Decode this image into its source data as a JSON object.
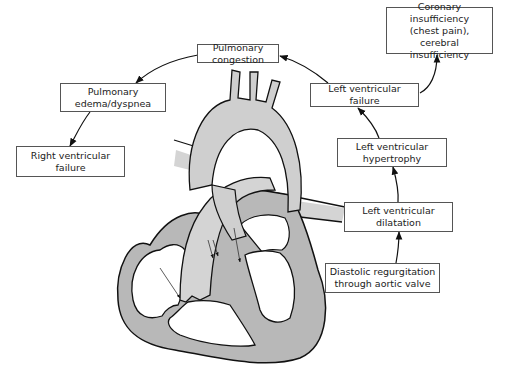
{
  "diagram": {
    "type": "flow-cycle-with-illustration",
    "colors": {
      "line": "#111111",
      "box_border": "#555555",
      "heart_wall": "#b8b8b8",
      "vessel_fill": "#d4d4d4",
      "chamber_fill": "#ffffff",
      "background": "#ffffff"
    },
    "nodes": [
      {
        "id": "coronary",
        "lines": [
          "Coronary insufficiency",
          "(chest pain), cerebral",
          "insufficiency"
        ]
      },
      {
        "id": "pulm_congestion",
        "lines": [
          "Pulmonary congestion"
        ]
      },
      {
        "id": "pulm_edema",
        "lines": [
          "Pulmonary",
          "edema/dyspnea"
        ]
      },
      {
        "id": "rv_failure",
        "lines": [
          "Right ventricular",
          "failure"
        ]
      },
      {
        "id": "lv_failure",
        "lines": [
          "Left ventricular failure"
        ]
      },
      {
        "id": "lv_hypertrophy",
        "lines": [
          "Left ventricular",
          "hypertrophy"
        ]
      },
      {
        "id": "lv_dilatation",
        "lines": [
          "Left ventricular",
          "dilatation"
        ]
      },
      {
        "id": "diastolic_regurg",
        "lines": [
          "Diastolic regurgitation",
          "through aortic valve"
        ]
      }
    ],
    "edges": [
      {
        "from": "diastolic_regurg",
        "to": "lv_dilatation"
      },
      {
        "from": "lv_dilatation",
        "to": "lv_hypertrophy"
      },
      {
        "from": "lv_hypertrophy",
        "to": "lv_failure"
      },
      {
        "from": "lv_failure",
        "to": "coronary"
      },
      {
        "from": "lv_failure",
        "to": "pulm_congestion"
      },
      {
        "from": "pulm_congestion",
        "to": "pulm_edema"
      },
      {
        "from": "pulm_edema",
        "to": "rv_failure"
      }
    ],
    "illustration": {
      "name": "heart-cross-section",
      "features": [
        "aortic arch with three branches",
        "pulmonary artery",
        "left and right atria",
        "left and right ventricles",
        "valve flow arrows"
      ]
    }
  }
}
